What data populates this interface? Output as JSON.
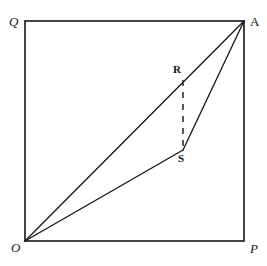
{
  "figure": {
    "kind": "geometry-diagram",
    "title": "",
    "background_color": "#ffffff",
    "stroke_color": "#141414",
    "label_color": "#141414"
  },
  "points": {
    "O": {
      "label": "O",
      "x": 25,
      "y": 241,
      "style": "italic"
    },
    "P": {
      "label": "P",
      "x": 244,
      "y": 241,
      "style": "italic"
    },
    "A": {
      "label": "A",
      "x": 244,
      "y": 21,
      "style": "upright"
    },
    "Q": {
      "label": "Q",
      "x": 25,
      "y": 21,
      "style": "italic"
    },
    "R": {
      "label": "R",
      "x": 183,
      "y": 80,
      "style": "bold"
    },
    "S": {
      "label": "S",
      "x": 183,
      "y": 150,
      "style": "bold"
    }
  },
  "square": {
    "name": "OPAQ",
    "left": 25,
    "top": 21,
    "right": 244,
    "bottom": 241,
    "stroke_width": 1.6,
    "dash": "solid"
  },
  "segments": [
    {
      "name": "O-to-A",
      "from": "O",
      "to": "A",
      "dash": "solid",
      "stroke_width": 1.3
    },
    {
      "name": "O-to-S",
      "from": "O",
      "to": "S",
      "dash": "solid",
      "stroke_width": 1.3
    },
    {
      "name": "S-to-A",
      "from": "S",
      "to": "A",
      "dash": "solid",
      "stroke_width": 1.3
    },
    {
      "name": "R-to-S",
      "from": "R",
      "to": "S",
      "dash": "dashed",
      "stroke_width": 1.4
    }
  ]
}
